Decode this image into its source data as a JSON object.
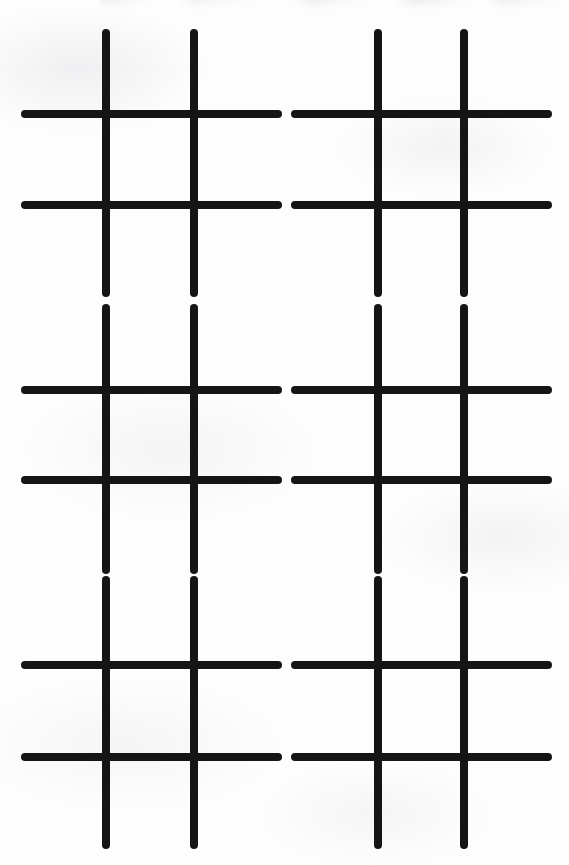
{
  "page": {
    "width": 569,
    "height": 865,
    "background_color": "#fdfdfd",
    "ink_color": "#151515",
    "top_edge_artifact": "faint remnant of cropped text cut off at the top edge"
  },
  "sheet": {
    "columns": 2,
    "rows": 3,
    "grid_count": 6,
    "stroke_width": 8,
    "stroke_linecap": "round",
    "column_x": [
      {
        "name": "left-column",
        "vertical_lines_x": [
          106,
          194
        ],
        "horizontal_start_x": 25,
        "horizontal_end_x": 278
      },
      {
        "name": "right-column",
        "vertical_lines_x": [
          378,
          464
        ],
        "horizontal_start_x": 295,
        "horizontal_end_x": 548
      }
    ],
    "row_y": [
      {
        "name": "top-row",
        "vertical_start_y": 33,
        "vertical_end_y": 293,
        "horizontal_lines_y": [
          114,
          205
        ]
      },
      {
        "name": "middle-row",
        "vertical_start_y": 308,
        "vertical_end_y": 570,
        "horizontal_lines_y": [
          390,
          480
        ]
      },
      {
        "name": "bottom-row",
        "vertical_start_y": 580,
        "vertical_end_y": 845,
        "horizontal_lines_y": [
          665,
          757
        ]
      }
    ],
    "grids": [
      {
        "id": "grid-1",
        "position": "top-left",
        "row": 1,
        "column": 1,
        "cells": [
          "",
          "",
          "",
          "",
          "",
          "",
          "",
          "",
          ""
        ]
      },
      {
        "id": "grid-2",
        "position": "top-right",
        "row": 1,
        "column": 2,
        "cells": [
          "",
          "",
          "",
          "",
          "",
          "",
          "",
          "",
          ""
        ]
      },
      {
        "id": "grid-3",
        "position": "middle-left",
        "row": 2,
        "column": 1,
        "cells": [
          "",
          "",
          "",
          "",
          "",
          "",
          "",
          "",
          ""
        ]
      },
      {
        "id": "grid-4",
        "position": "middle-right",
        "row": 2,
        "column": 2,
        "cells": [
          "",
          "",
          "",
          "",
          "",
          "",
          "",
          "",
          ""
        ]
      },
      {
        "id": "grid-5",
        "position": "bottom-left",
        "row": 3,
        "column": 1,
        "cells": [
          "",
          "",
          "",
          "",
          "",
          "",
          "",
          "",
          ""
        ]
      },
      {
        "id": "grid-6",
        "position": "bottom-right",
        "row": 3,
        "column": 2,
        "cells": [
          "",
          "",
          "",
          "",
          "",
          "",
          "",
          "",
          ""
        ]
      }
    ]
  }
}
